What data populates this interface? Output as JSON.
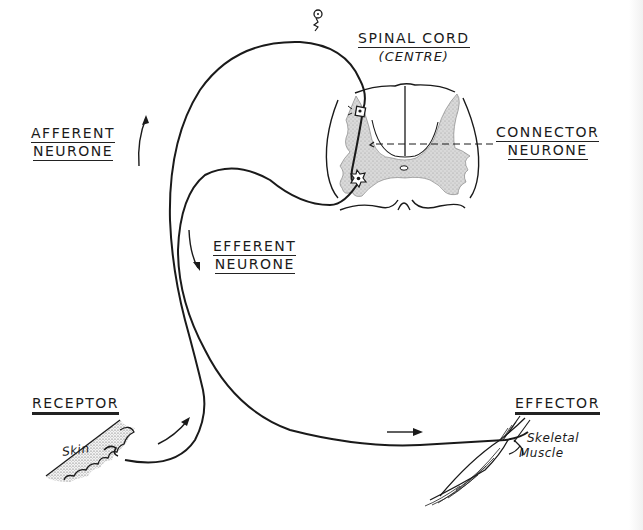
{
  "diagram": {
    "type": "reflex-arc",
    "colors": {
      "ink": "#1a1a1a",
      "grey_matter": "#d4d4d4",
      "background": "#ffffff"
    },
    "labels": {
      "spinal_cord": {
        "title": "SPINAL CORD",
        "subtitle": "(CENTRE)"
      },
      "afferent": {
        "line1": "AFFERENT",
        "line2": "NEURONE"
      },
      "efferent": {
        "line1": "EFFERENT",
        "line2": "NEURONE"
      },
      "connector": {
        "line1": "CONNECTOR",
        "line2": "NEURONE"
      },
      "receptor": "RECEPTOR",
      "effector": "EFFECTOR",
      "skin": "Skin",
      "muscle": {
        "line1": "Skeletal",
        "line2": "Muscle"
      }
    },
    "nodes": [
      {
        "id": "receptor",
        "label": "RECEPTOR",
        "detail": "Skin"
      },
      {
        "id": "afferent",
        "label": "AFFERENT NEURONE"
      },
      {
        "id": "spinal-cord",
        "label": "SPINAL CORD (CENTRE)"
      },
      {
        "id": "connector",
        "label": "CONNECTOR NEURONE"
      },
      {
        "id": "efferent",
        "label": "EFFERENT NEURONE"
      },
      {
        "id": "effector",
        "label": "EFFECTOR",
        "detail": "Skeletal Muscle"
      }
    ],
    "edges": [
      {
        "from": "receptor",
        "to": "afferent"
      },
      {
        "from": "afferent",
        "to": "spinal-cord"
      },
      {
        "from": "spinal-cord",
        "to": "connector"
      },
      {
        "from": "connector",
        "to": "efferent"
      },
      {
        "from": "efferent",
        "to": "effector"
      }
    ]
  }
}
